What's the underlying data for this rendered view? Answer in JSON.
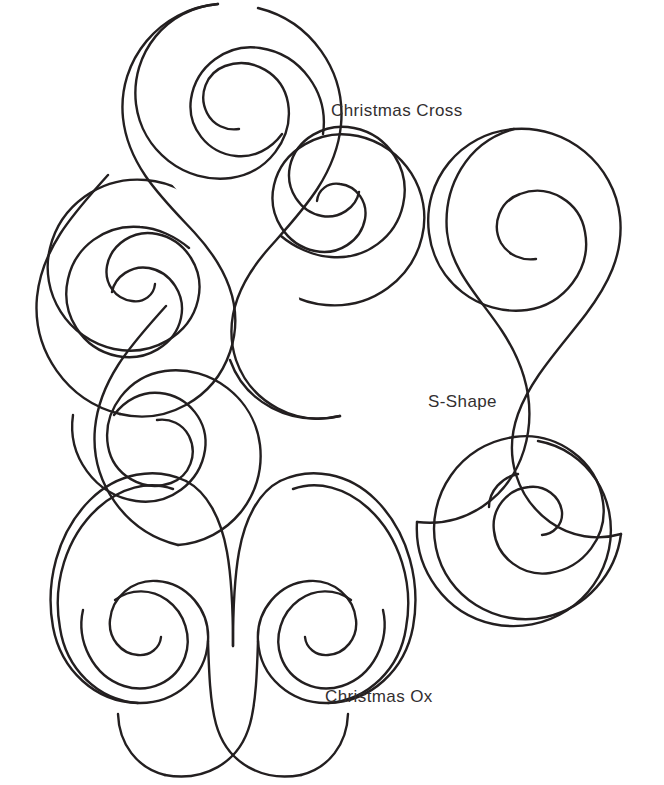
{
  "page": {
    "kind": "line-art-template-sheet",
    "background_color": "#ffffff",
    "stroke_color": "#231f20",
    "text_color": "#332f30",
    "width": 664,
    "height": 785
  },
  "motifs": [
    {
      "id": "christmas-cross",
      "label": "Christmas Cross",
      "description": "Two interlaced S-shaped ribbons crossing at the center, forming a four-armed spiral cross; each arm terminates in a rolled spiral.",
      "arm_count": 4,
      "spiral_count": 4,
      "label_position": {
        "x": 331,
        "y": 101
      }
    },
    {
      "id": "s-shape",
      "label": "S-Shape",
      "description": "A single outlined ribbon bent into an S with a rolled spiral curl at each end.",
      "arm_count": 2,
      "spiral_count": 2,
      "label_position": {
        "x": 428,
        "y": 392
      }
    },
    {
      "id": "christmas-ox",
      "label": "Christmas Ox",
      "description": "A ram-horn / U-shaped outline with a deep narrow V notch at the top center and a rolled spiral at each outer end.",
      "arm_count": 2,
      "spiral_count": 2,
      "label_position": {
        "x": 325,
        "y": 687
      }
    }
  ]
}
